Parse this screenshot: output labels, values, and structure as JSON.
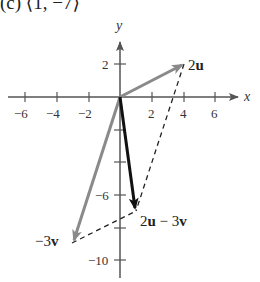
{
  "header": {
    "text": "(c) ⟨1, −7⟩"
  },
  "axes": {
    "x_label": "x",
    "y_label": "y",
    "x_ticks": [
      {
        "value": -6,
        "label": "−6"
      },
      {
        "value": -4,
        "label": "−4"
      },
      {
        "value": -2,
        "label": "−2"
      },
      {
        "value": 2,
        "label": "2"
      },
      {
        "value": 4,
        "label": "4"
      },
      {
        "value": 6,
        "label": "6"
      }
    ],
    "y_ticks": [
      {
        "value": 2,
        "label": "2"
      },
      {
        "value": -2,
        "label": ""
      },
      {
        "value": -4,
        "label": ""
      },
      {
        "value": -6,
        "label": "−6"
      },
      {
        "value": -8,
        "label": ""
      },
      {
        "value": -10,
        "label": "−10"
      }
    ]
  },
  "vectors": {
    "two_u": {
      "label_coef": "2",
      "label_var": "u",
      "tip": [
        4,
        2
      ],
      "color": "#8a8a8a"
    },
    "neg_three_v": {
      "label_coef": "−3",
      "label_var": "v",
      "tip": [
        -3,
        -9
      ],
      "color": "#8a8a8a"
    },
    "result": {
      "label_a": "2",
      "label_b": "u",
      "label_op": " − 3",
      "label_c": "v",
      "tip": [
        1,
        -7
      ],
      "color": "#111111"
    }
  },
  "colors": {
    "axis": "#555555",
    "dashed": "#222222"
  }
}
